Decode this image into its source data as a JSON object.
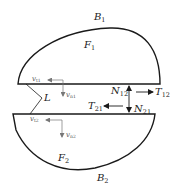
{
  "diagram": {
    "bodies": [
      {
        "id": "B1",
        "label": "B",
        "sub": "1",
        "region_label": "F",
        "region_sub": "1"
      },
      {
        "id": "B2",
        "label": "B",
        "sub": "2",
        "region_label": "F",
        "region_sub": "2"
      }
    ],
    "gap_label": {
      "label": "L",
      "sub": ""
    },
    "forces": {
      "N12": {
        "label": "N",
        "sub": "12"
      },
      "T12": {
        "label": "T",
        "sub": "12"
      },
      "T21": {
        "label": "T",
        "sub": "21"
      },
      "N21": {
        "label": "N",
        "sub": "21"
      }
    },
    "velocities": {
      "vt1": {
        "label": "v",
        "sub": "t1"
      },
      "vn1": {
        "label": "v",
        "sub": "n1"
      },
      "vt2": {
        "label": "v",
        "sub": "t2"
      },
      "vn2": {
        "label": "v",
        "sub": "n2"
      }
    },
    "colors": {
      "stroke": "#1a1a1a",
      "light_stroke": "#666666",
      "background": "#ffffff"
    }
  }
}
